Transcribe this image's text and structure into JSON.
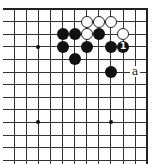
{
  "diagram": {
    "type": "go-board-fragment",
    "grid": {
      "columns_visible": 12,
      "rows_visible": 13,
      "top_edge": true,
      "right_edge": true,
      "left_edge": false,
      "bottom_edge": false
    },
    "star_points": [
      {
        "col": 2,
        "row": 3
      },
      {
        "col": 2,
        "row": 9
      },
      {
        "col": 8,
        "row": 9
      }
    ],
    "stones": [
      {
        "color": "white",
        "col": 6,
        "row": 1
      },
      {
        "color": "white",
        "col": 7,
        "row": 1
      },
      {
        "color": "white",
        "col": 8,
        "row": 1
      },
      {
        "color": "black",
        "col": 4,
        "row": 2
      },
      {
        "color": "black",
        "col": 5,
        "row": 2
      },
      {
        "color": "white",
        "col": 6,
        "row": 2
      },
      {
        "color": "black",
        "col": 7,
        "row": 2
      },
      {
        "color": "white",
        "col": 9,
        "row": 2
      },
      {
        "color": "black",
        "col": 4,
        "row": 3
      },
      {
        "color": "black",
        "col": 6,
        "row": 3
      },
      {
        "color": "black",
        "col": 8,
        "row": 3
      },
      {
        "color": "black",
        "col": 9,
        "row": 3,
        "mark": "1"
      },
      {
        "color": "black",
        "col": 5,
        "row": 4
      },
      {
        "color": "black",
        "col": 8,
        "row": 5
      }
    ],
    "labels": [
      {
        "text": "a",
        "col": 10,
        "row": 5
      }
    ],
    "colors": {
      "black_stone": "#111111",
      "white_stone": "#ffffff",
      "grid_line": "#333333"
    }
  }
}
